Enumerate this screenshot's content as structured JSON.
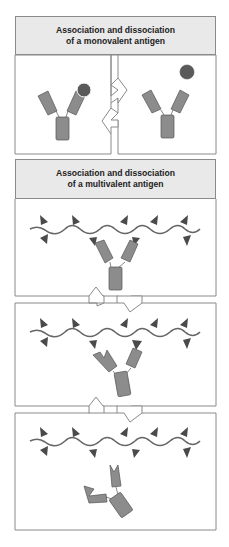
{
  "diagram": {
    "monovalent": {
      "title_line1": "Association and dissociation",
      "title_line2": "of a monovalent antigen",
      "states": [
        "antibody-bound-to-antigen",
        "antibody-and-free-antigen"
      ],
      "arrow": "reversible-equilibrium"
    },
    "multivalent": {
      "title_line1": "Association and dissociation",
      "title_line2": "of a multivalent antigen",
      "states": [
        "both-arms-bound",
        "one-arm-bound",
        "antibody-released"
      ],
      "arrows": [
        "reversible-equilibrium",
        "reversible-equilibrium"
      ]
    },
    "colors": {
      "antibody": "#8c8c8c",
      "antigen_sphere": "#5a5a5a",
      "epitope": "#4a4a4a",
      "header_bg": "#e9e9e9",
      "border": "#8a8a8a"
    }
  }
}
